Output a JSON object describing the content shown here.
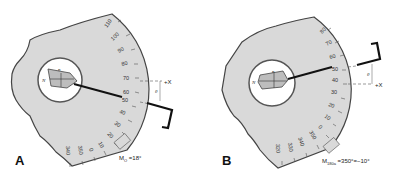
{
  "panels": [
    {
      "letter": "A",
      "caption": "M₀ = 18°",
      "caption_main": "M",
      "caption_sub": "O",
      "caption_rest": " =18°",
      "axis_label": "+X",
      "angle_symbol": "θ",
      "crystal_labels": {
        "top": "n",
        "left": "N"
      },
      "scale_labels": [
        "110",
        "100",
        "90",
        "80",
        "70",
        "60",
        "50",
        "40",
        "30",
        "20",
        "10",
        "0",
        "350",
        "340"
      ]
    },
    {
      "letter": "B",
      "caption_main": "M",
      "caption_sub": "180a",
      "caption_rest": " =350°=−10°",
      "axis_label": "+X",
      "angle_symbol": "θ",
      "crystal_labels": {
        "top": "n",
        "left": "N"
      },
      "scale_labels": [
        "80",
        "70",
        "60",
        "50",
        "40",
        "30",
        "20",
        "10",
        "0",
        "350",
        "340",
        "330",
        "320"
      ]
    }
  ],
  "colors": {
    "stage_fill": "#d9d9d9",
    "stage_edge": "#444444",
    "arm": "#111111",
    "background": "#ffffff"
  }
}
